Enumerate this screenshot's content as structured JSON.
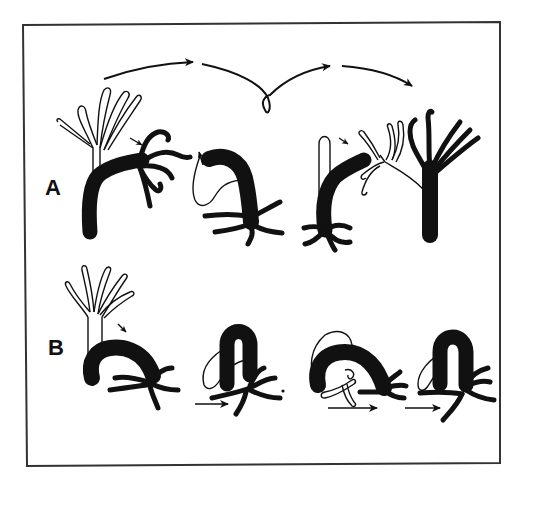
{
  "figure": {
    "panels": [
      {
        "id": "A",
        "label": "A",
        "description": "somersaulting locomotion sequence"
      },
      {
        "id": "B",
        "label": "B",
        "description": "inchworm-like looping locomotion sequence"
      }
    ],
    "colors": {
      "ink": "#111111",
      "paper": "#ffffff",
      "frame": "#333333"
    }
  }
}
